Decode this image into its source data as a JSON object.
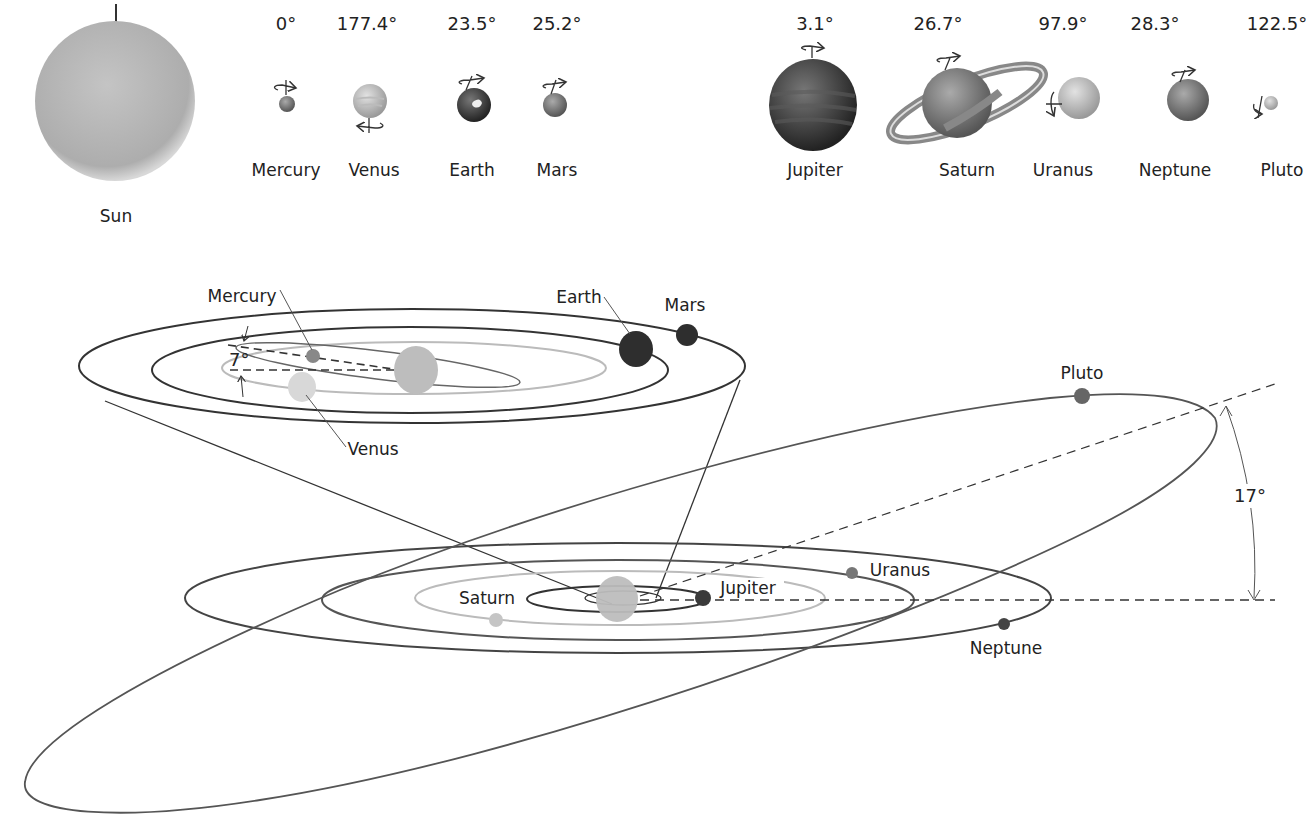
{
  "sun": {
    "label": "Sun"
  },
  "planets": [
    {
      "name": "Mercury",
      "tilt": "0°"
    },
    {
      "name": "Venus",
      "tilt": "177.4°"
    },
    {
      "name": "Earth",
      "tilt": "23.5°"
    },
    {
      "name": "Mars",
      "tilt": "25.2°"
    },
    {
      "name": "Jupiter",
      "tilt": "3.1°"
    },
    {
      "name": "Saturn",
      "tilt": "26.7°"
    },
    {
      "name": "Uranus",
      "tilt": "97.9°"
    },
    {
      "name": "Neptune",
      "tilt": "28.3°"
    },
    {
      "name": "Pluto",
      "tilt": "122.5°"
    }
  ],
  "inner_orbits": {
    "labels": {
      "mercury": "Mercury",
      "venus": "Venus",
      "earth": "Earth",
      "mars": "Mars"
    },
    "mercury_inclination": "7°"
  },
  "outer_orbits": {
    "labels": {
      "jupiter": "Jupiter",
      "saturn": "Saturn",
      "uranus": "Uranus",
      "neptune": "Neptune",
      "pluto": "Pluto"
    },
    "pluto_inclination": "17°"
  },
  "colors": {
    "line": "#333333",
    "light_orbit": "#bbbbbb",
    "sun": "#b5b5b5"
  }
}
